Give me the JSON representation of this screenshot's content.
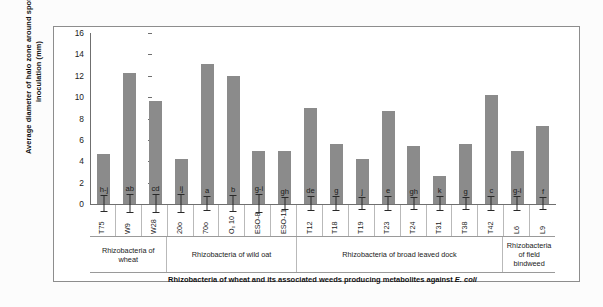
{
  "chart_data": {
    "type": "bar",
    "title": "",
    "xlabel": "Rhizobacteria of wheat and its associated weeds producing metabolites against E. coli",
    "ylabel": "Average diameter of halo zone around spot of inoculation (mm)",
    "ylim": [
      0,
      16
    ],
    "ytick_values": [
      16,
      14,
      12,
      10,
      8,
      6,
      4,
      2,
      0
    ],
    "ytick_labels": [
      "16",
      "14",
      "12",
      "10",
      "8",
      "6",
      "4",
      "2",
      "0"
    ],
    "grid": false,
    "legend": "none",
    "bar_color": "#8b8b8b",
    "error_color": "#2a2a2a",
    "categories": [
      "T75",
      "W9",
      "W28",
      "20o",
      "70o",
      "O₀ 10",
      "ESO-8",
      "ESO-11",
      "T12",
      "T18",
      "T19",
      "T23",
      "T24",
      "T31",
      "T38",
      "T42",
      "L6",
      "L9"
    ],
    "values": [
      4.7,
      12.3,
      9.6,
      4.2,
      13.1,
      12.0,
      5.0,
      5.0,
      9.0,
      5.6,
      4.2,
      8.7,
      5.4,
      2.6,
      5.6,
      10.2,
      5.0,
      7.3
    ],
    "errors": [
      0.75,
      0.85,
      0.8,
      0.85,
      0.7,
      0.75,
      0.8,
      0.55,
      0.7,
      0.65,
      0.55,
      0.7,
      0.6,
      0.65,
      0.6,
      0.7,
      0.65,
      0.6
    ],
    "significance_letters": [
      "h-j",
      "ab",
      "cd",
      "ij",
      "a",
      "b",
      "g-i",
      "gh",
      "de",
      "g",
      "j",
      "e",
      "gh",
      "k",
      "g",
      "c",
      "g-i",
      "f"
    ],
    "groups": [
      {
        "label": "Rhizobacteria of wheat",
        "span": 3
      },
      {
        "label": "Rhizobacteria of wild oat",
        "span": 5
      },
      {
        "label": "Rhizobacteria of broad leaved dock",
        "span": 8
      },
      {
        "label": "Rhizobacteria of field bindweed",
        "span": 2
      }
    ]
  },
  "axis": {
    "y_title": "Average diameter of halo zone around spot of inoculation (mm)",
    "x_title_plain": "Rhizobacteria of wheat and its associated weeds producing metabolites against ",
    "x_title_italic": "E. coli"
  }
}
